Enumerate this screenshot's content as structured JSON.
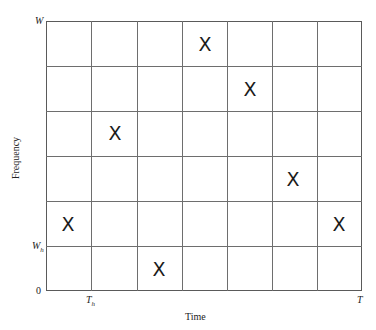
{
  "diagram": {
    "type": "time-frequency hopping grid",
    "xlabel": "Time",
    "ylabel": "Frequency",
    "x_ticks": [
      {
        "label": "T",
        "sub": "h",
        "pos": 91
      },
      {
        "label": "T",
        "sub": "",
        "pos": 362
      }
    ],
    "y_ticks": [
      {
        "label": "W",
        "sub": "",
        "pos": 21
      },
      {
        "label": "W",
        "sub": "h",
        "pos": 246
      },
      {
        "label": "0",
        "sub": "",
        "pos": 291
      }
    ],
    "grid": {
      "columns": 7,
      "rows": 6
    },
    "marker_symbol": "X",
    "markers": [
      {
        "col": 0,
        "row_from_bottom": 1
      },
      {
        "col": 1,
        "row_from_bottom": 3
      },
      {
        "col": 2,
        "row_from_bottom": 0
      },
      {
        "col": 3,
        "row_from_bottom": 5
      },
      {
        "col": 4,
        "row_from_bottom": 4
      },
      {
        "col": 5,
        "row_from_bottom": 2
      },
      {
        "col": 6,
        "row_from_bottom": 1
      }
    ]
  }
}
